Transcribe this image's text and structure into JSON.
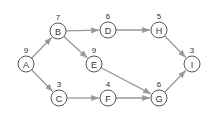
{
  "diagram": {
    "type": "directed-graph",
    "nodes": [
      {
        "id": "A",
        "label": "A",
        "weight": "9"
      },
      {
        "id": "B",
        "label": "B",
        "weight": "7"
      },
      {
        "id": "C",
        "label": "C",
        "weight": "3"
      },
      {
        "id": "D",
        "label": "D",
        "weight": "6"
      },
      {
        "id": "E",
        "label": "E",
        "weight": "9"
      },
      {
        "id": "F",
        "label": "F",
        "weight": "4"
      },
      {
        "id": "G",
        "label": "G",
        "weight": "6"
      },
      {
        "id": "H",
        "label": "H",
        "weight": "5"
      },
      {
        "id": "I",
        "label": "I",
        "weight": "3"
      }
    ],
    "edges": [
      {
        "from": "A",
        "to": "B"
      },
      {
        "from": "A",
        "to": "C"
      },
      {
        "from": "B",
        "to": "D"
      },
      {
        "from": "B",
        "to": "E"
      },
      {
        "from": "D",
        "to": "H"
      },
      {
        "from": "H",
        "to": "I"
      },
      {
        "from": "E",
        "to": "G"
      },
      {
        "from": "C",
        "to": "F"
      },
      {
        "from": "F",
        "to": "G"
      },
      {
        "from": "G",
        "to": "I"
      }
    ],
    "colors": {
      "edge": "#999999",
      "node_stroke": "#555555",
      "text": "#333333"
    }
  }
}
